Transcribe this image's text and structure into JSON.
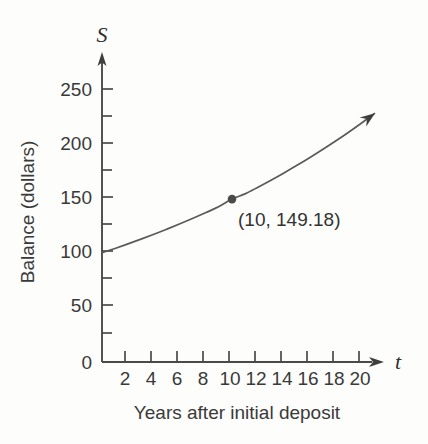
{
  "chart_data": {
    "type": "line",
    "title": "",
    "subtitle": "",
    "xlabel": "Years after initial deposit",
    "ylabel": "Balance (dollars)",
    "x_axis_variable": "t",
    "y_axis_variable": "S",
    "xlim": [
      0,
      21.5
    ],
    "ylim": [
      0,
      262
    ],
    "grid": false,
    "legend": null,
    "x_ticks_major": [
      2,
      4,
      6,
      8,
      10,
      12,
      14,
      16,
      18,
      20
    ],
    "x_tick_labels": [
      "2",
      "4",
      "6",
      "8",
      "10",
      "12",
      "14",
      "16",
      "18",
      "20"
    ],
    "y_ticks_major": [
      0,
      50,
      100,
      150,
      200,
      250
    ],
    "y_tick_labels": [
      "0",
      "50",
      "100",
      "150",
      "200",
      "250"
    ],
    "y_ticks_minor": [
      25,
      75,
      125,
      175,
      225
    ],
    "axis_arrows": [
      "x-right",
      "y-up"
    ],
    "curve_arrow_end": true,
    "series": [
      {
        "name": "Balance",
        "curve": "exponential growth",
        "x": [
          0,
          1,
          2,
          3,
          4,
          5,
          6,
          7,
          8,
          9,
          10,
          11,
          12,
          13,
          14,
          15,
          16,
          17,
          18,
          19,
          20,
          21
        ],
        "values": [
          100,
          104,
          108.16,
          112.49,
          116.99,
          121.67,
          126.53,
          131.59,
          136.86,
          142.33,
          149.18,
          153.95,
          160.1,
          166.51,
          173.17,
          180.09,
          187.3,
          194.79,
          202.58,
          210.68,
          219.11,
          227.88
        ]
      }
    ],
    "annotations": [
      {
        "name": "highlighted-point",
        "label": "(10, 149.18)",
        "x": 10,
        "y": 149.18,
        "marker": "filled-circle"
      }
    ]
  },
  "colors": {
    "background": "#fdfdfc",
    "axis": "#4a4a4a",
    "curve": "#5a5a5a",
    "text": "#3a3a3a",
    "marker": "#4a4a4a"
  }
}
